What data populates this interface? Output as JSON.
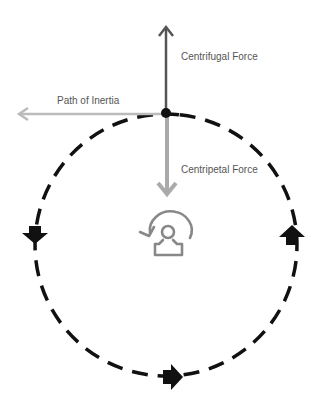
{
  "diagram": {
    "labels": {
      "centrifugal": "Centrifugal Force",
      "inertia": "Path of Inertia",
      "centripetal": "Centripetal Force"
    },
    "colors": {
      "centrifugal_arrow": "#555555",
      "inertia_arrow": "#bbbbbb",
      "centripetal_arrow": "#aaaaaa",
      "orbit": "#111111",
      "object": "#111111",
      "center_icon": "#888888"
    },
    "orbit": {
      "cx": 166,
      "cy": 245,
      "r": 131,
      "style": "dashed"
    },
    "object_position": {
      "x": 166,
      "y": 113
    },
    "direction_arrows": [
      "down-left",
      "right-bottom",
      "up-right"
    ],
    "center_icon": "rotating-person-icon"
  }
}
